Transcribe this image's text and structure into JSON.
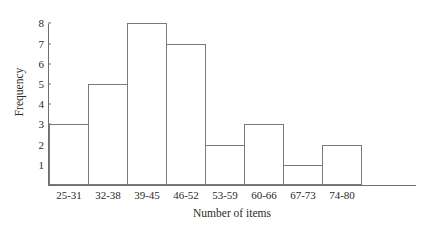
{
  "chart_data": {
    "type": "bar",
    "title": "",
    "subtitle": "",
    "xlabel": "Number of items",
    "ylabel": "Frequency",
    "categories": [
      "25-31",
      "32-38",
      "39-45",
      "46-52",
      "53-59",
      "60-66",
      "67-73",
      "74-80"
    ],
    "values": [
      3,
      5,
      8,
      7,
      2,
      3,
      1,
      2
    ],
    "series": [
      {
        "name": "Frequency",
        "values": [
          3,
          5,
          8,
          7,
          2,
          3,
          1,
          2
        ]
      }
    ],
    "ylim": [
      0,
      8.6
    ],
    "xlim_categories": 8,
    "yticks": [
      1,
      2,
      3,
      4,
      5,
      6,
      7,
      8
    ],
    "ytick_labels": [
      "1",
      "2",
      "3",
      "4",
      "5",
      "6",
      "7",
      "8"
    ],
    "grid": false,
    "legend": false,
    "legend_position": "none",
    "bar_gap": 0,
    "annotations": [],
    "colors": {
      "bar_fill": "#ffffff",
      "bar_edge": "#7a7a7a",
      "axis": "#6f6f6f",
      "text": "#2a2a2a",
      "background": "#ffffff"
    }
  }
}
